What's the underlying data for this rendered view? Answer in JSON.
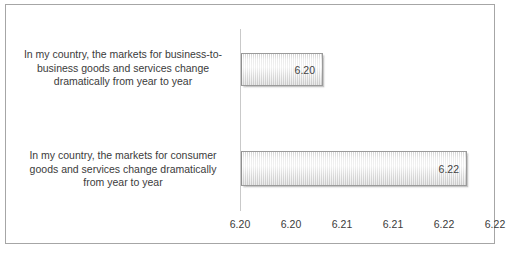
{
  "chart_data": {
    "type": "bar",
    "orientation": "horizontal",
    "title": "",
    "xlabel": "",
    "ylabel": "",
    "grid": false,
    "legend": false,
    "categories": [
      "In my country, the markets for business-to-business goods and services change dramatically from year to year",
      "In my country, the markets for consumer goods and services change dramatically from year to year"
    ],
    "category_lines": [
      [
        "In my country, the markets for business-to-",
        "business goods and services change",
        "dramatically from year to year"
      ],
      [
        "In my country, the markets for consumer",
        "goods and services change dramatically",
        "from year to year"
      ]
    ],
    "values": [
      6.2,
      6.22
    ],
    "value_labels": [
      "6.20",
      "6.22"
    ],
    "bar_pixel_widths": [
      82,
      226
    ],
    "xlim": [
      6.195,
      6.2225
    ],
    "axis_tick_labels": [
      "6.20",
      "6.20",
      "6.21",
      "6.21",
      "6.22",
      "6.22"
    ],
    "axis_tick_positions_px": [
      0,
      51,
      102,
      153,
      204,
      255
    ]
  },
  "style": {
    "frame_border_color": "#a6a6a6",
    "axis_line_color": "#c9c9c9",
    "bar_fill_color": "#e8e8e8",
    "bar_border_color": "#9a9a9a",
    "text_color": "#3b3b3b",
    "value_text_color": "#434343",
    "background_color": "#ffffff"
  }
}
